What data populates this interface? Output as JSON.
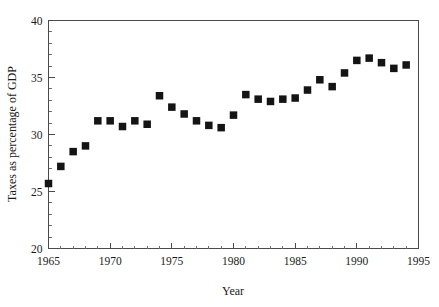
{
  "chart_data": {
    "type": "scatter",
    "title": "",
    "xlabel": "Year",
    "ylabel": "Taxes as percentage of GDP",
    "xlim": [
      1965,
      1995
    ],
    "ylim": [
      20,
      40
    ],
    "x_ticks": [
      1965,
      1970,
      1975,
      1980,
      1985,
      1990,
      1995
    ],
    "x_tick_labels": [
      "1965",
      "1970",
      "1975",
      "1980",
      "1985",
      "1990",
      "1995"
    ],
    "x_minor_tick_step": 1,
    "y_ticks": [
      20,
      25,
      30,
      35,
      40
    ],
    "y_tick_labels": [
      "20",
      "25",
      "30",
      "35",
      "40"
    ],
    "y_minor_tick_step": 1,
    "grid": false,
    "legend": null,
    "marker": "filled-square",
    "marker_color": "#141414",
    "x": [
      1965,
      1966,
      1967,
      1968,
      1969,
      1970,
      1971,
      1972,
      1973,
      1974,
      1975,
      1976,
      1977,
      1978,
      1979,
      1980,
      1981,
      1982,
      1983,
      1984,
      1985,
      1986,
      1987,
      1988,
      1989,
      1990,
      1991,
      1992,
      1993,
      1994
    ],
    "values": [
      25.7,
      27.2,
      28.5,
      29.0,
      31.2,
      31.2,
      30.7,
      31.2,
      30.9,
      33.4,
      32.4,
      31.8,
      31.2,
      30.8,
      30.6,
      31.7,
      33.5,
      33.1,
      32.9,
      33.1,
      33.2,
      33.9,
      34.8,
      34.2,
      35.4,
      36.5,
      36.7,
      36.3,
      35.8,
      36.1
    ],
    "points": [
      {
        "year": 1965,
        "value": 25.7
      },
      {
        "year": 1966,
        "value": 27.2
      },
      {
        "year": 1967,
        "value": 28.5
      },
      {
        "year": 1968,
        "value": 29.0
      },
      {
        "year": 1969,
        "value": 31.2
      },
      {
        "year": 1970,
        "value": 31.2
      },
      {
        "year": 1971,
        "value": 30.7
      },
      {
        "year": 1972,
        "value": 31.2
      },
      {
        "year": 1973,
        "value": 30.9
      },
      {
        "year": 1974,
        "value": 33.4
      },
      {
        "year": 1975,
        "value": 32.4
      },
      {
        "year": 1976,
        "value": 31.8
      },
      {
        "year": 1977,
        "value": 31.2
      },
      {
        "year": 1978,
        "value": 30.8
      },
      {
        "year": 1979,
        "value": 30.6
      },
      {
        "year": 1980,
        "value": 31.7
      },
      {
        "year": 1981,
        "value": 33.5
      },
      {
        "year": 1982,
        "value": 33.1
      },
      {
        "year": 1983,
        "value": 32.9
      },
      {
        "year": 1984,
        "value": 33.1
      },
      {
        "year": 1985,
        "value": 33.2
      },
      {
        "year": 1986,
        "value": 33.9
      },
      {
        "year": 1987,
        "value": 34.8
      },
      {
        "year": 1988,
        "value": 34.2
      },
      {
        "year": 1989,
        "value": 35.4
      },
      {
        "year": 1990,
        "value": 36.5
      },
      {
        "year": 1991,
        "value": 36.7
      },
      {
        "year": 1992,
        "value": 36.3
      },
      {
        "year": 1993,
        "value": 35.8
      },
      {
        "year": 1994,
        "value": 36.1
      }
    ]
  },
  "style": {
    "axis_color": "#4a4a4a",
    "marker_color": "#141414",
    "background": "#ffffff"
  }
}
